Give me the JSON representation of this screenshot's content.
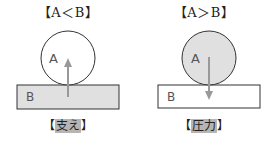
{
  "left_panel": {
    "title": "【A＜B】",
    "circle_label": "A",
    "block_label": "B",
    "caption_open": "【",
    "caption_word": "支え",
    "caption_close": "】",
    "circle_fill": "#ffffff",
    "block_fill": "#e0e0e0",
    "arrow_direction": "up"
  },
  "right_panel": {
    "title": "【A＞B】",
    "circle_label": "A",
    "block_label": "B",
    "caption_open": "【",
    "caption_word": "圧力",
    "caption_close": "】",
    "circle_fill": "#e0e0e0",
    "block_fill": "#ffffff",
    "arrow_direction": "down"
  },
  "colors": {
    "stroke": "#333333",
    "arrow": "#999999",
    "highlight": "#b5b5b5"
  }
}
